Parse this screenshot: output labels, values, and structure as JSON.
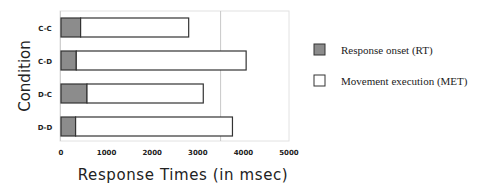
{
  "chart_data": {
    "type": "bar",
    "orientation": "horizontal",
    "stacked": true,
    "title": "",
    "categories": [
      "C-C",
      "C-D",
      "D-C",
      "D-D"
    ],
    "series": [
      {
        "name": "Response onset (RT)",
        "color": "#8c8c8c",
        "values": [
          430,
          335,
          570,
          320
        ]
      },
      {
        "name": "Movement execution (MET)",
        "color": "#ffffff",
        "values": [
          2370,
          3725,
          2550,
          3440
        ]
      }
    ],
    "totals": [
      2800,
      4060,
      3120,
      3760
    ],
    "xlabel": "Response Times (in msec)",
    "ylabel": "Condition",
    "xlim": [
      0,
      5000
    ],
    "xticks": [
      "0",
      "1000",
      "2000",
      "3000",
      "4000",
      "5000"
    ],
    "reference_line_x": 3500,
    "grid": false,
    "legend_position": "right"
  },
  "legend": {
    "items": [
      {
        "label": "Response onset (RT)",
        "color": "#8c8c8c"
      },
      {
        "label": "Movement execution (MET)",
        "color": "#ffffff"
      }
    ]
  }
}
